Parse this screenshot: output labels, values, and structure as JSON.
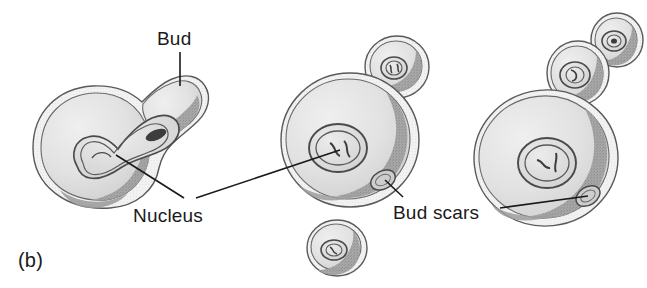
{
  "figure": {
    "panel_label": "(b)",
    "background_color": "#ffffff",
    "ink_color": "#1a1a1a"
  },
  "labels": {
    "bud": "Bud",
    "nucleus": "Nucleus",
    "bud_scars": "Bud scars"
  },
  "palette": {
    "outline": "#4a4a4a",
    "cytoplasm_light": "#e6e6e6",
    "cytoplasm_mid": "#d4d4d4",
    "shading_dark": "#9a9a9a",
    "shading_darker": "#8a8a8a",
    "nucleus_fill": "#dcdcdc",
    "nucleus_outline": "#4a4a4a",
    "scar_fill": "#c8c8c8",
    "leader_line": "#1a1a1a"
  },
  "cells": [
    {
      "name": "budding-mother-cell-left",
      "description": "Mother cell with large emerging bud and dumbbell-shaped dividing nucleus spanning the neck",
      "nuclei": 1,
      "buds": 1,
      "bud_scars": 0
    },
    {
      "name": "mother-cell-middle",
      "description": "Round mother cell with one small bud at upper right, central nucleus and one bud scar at lower right",
      "nuclei": 1,
      "buds": 1,
      "bud_scars": 1
    },
    {
      "name": "detached-daughter-cell",
      "description": "Small free daughter cell with its own nucleus below the middle mother cell",
      "nuclei": 1,
      "buds": 0,
      "bud_scars": 0
    },
    {
      "name": "mother-cell-right",
      "description": "Large mother cell with a chain of two stacked buds at upper right, central nucleus and one bud scar at lower right",
      "nuclei": 1,
      "buds": 2,
      "bud_scars": 1
    }
  ]
}
